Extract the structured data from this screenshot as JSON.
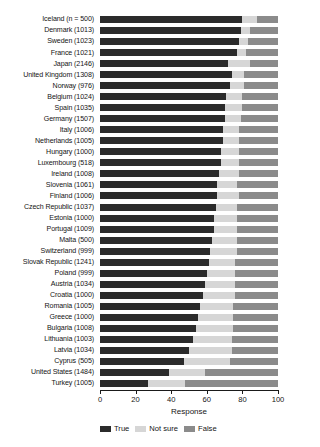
{
  "chart_data": {
    "type": "bar",
    "orientation": "horizontal",
    "stacked": true,
    "stack_mode": "percent",
    "title": "",
    "xlabel": "Response",
    "ylabel": "",
    "xlim": [
      0,
      100
    ],
    "xticks": [
      0,
      20,
      40,
      60,
      80,
      100
    ],
    "grid": false,
    "legend_position": "bottom",
    "legend": [
      "True",
      "Not sure",
      "False"
    ],
    "colors": {
      "True": "#2b2b2b",
      "Not sure": "#d6d6d6",
      "False": "#8b8b8b",
      "background": "#ffffff",
      "text": "#151515"
    },
    "categories": [
      "Iceland (n = 500)",
      "Denmark (1013)",
      "Sweden (1023)",
      "France (1021)",
      "Japan (2146)",
      "United Kingdom (1308)",
      "Norway (976)",
      "Belgium (1024)",
      "Spain (1035)",
      "Germany (1507)",
      "Italy (1006)",
      "Netherlands (1005)",
      "Hungary (1000)",
      "Luxembourg (518)",
      "Ireland (1008)",
      "Slovenia (1061)",
      "Finland (1006)",
      "Czech Republic (1037)",
      "Estonia (1000)",
      "Portugal (1009)",
      "Malta (500)",
      "Switzerland (999)",
      "Slovak Republic (1241)",
      "Poland (999)",
      "Austria (1034)",
      "Croatia (1000)",
      "Romania (1005)",
      "Greece (1000)",
      "Bulgaria (1008)",
      "Lithuania (1003)",
      "Latvia (1034)",
      "Cyprus (505)",
      "United States (1484)",
      "Turkey (1005)"
    ],
    "series": [
      {
        "name": "True",
        "values": [
          80,
          79,
          78,
          77,
          72,
          74,
          73,
          71,
          70,
          70,
          69,
          69,
          68,
          68,
          67,
          66,
          66,
          65,
          64,
          64,
          63,
          62,
          61,
          60,
          59,
          58,
          56,
          55,
          54,
          52,
          50,
          47,
          39,
          27
        ]
      },
      {
        "name": "Not sure",
        "values": [
          8,
          5,
          5,
          5,
          12,
          7,
          8,
          9,
          10,
          9,
          9,
          9,
          10,
          10,
          11,
          11,
          12,
          12,
          13,
          13,
          14,
          15,
          15,
          16,
          17,
          18,
          19,
          20,
          21,
          22,
          24,
          26,
          20,
          21
        ]
      },
      {
        "name": "False",
        "values": [
          12,
          16,
          17,
          18,
          16,
          19,
          19,
          20,
          20,
          21,
          22,
          22,
          22,
          22,
          22,
          23,
          22,
          23,
          23,
          23,
          23,
          23,
          24,
          24,
          24,
          24,
          25,
          25,
          25,
          26,
          26,
          27,
          41,
          52
        ]
      }
    ]
  }
}
